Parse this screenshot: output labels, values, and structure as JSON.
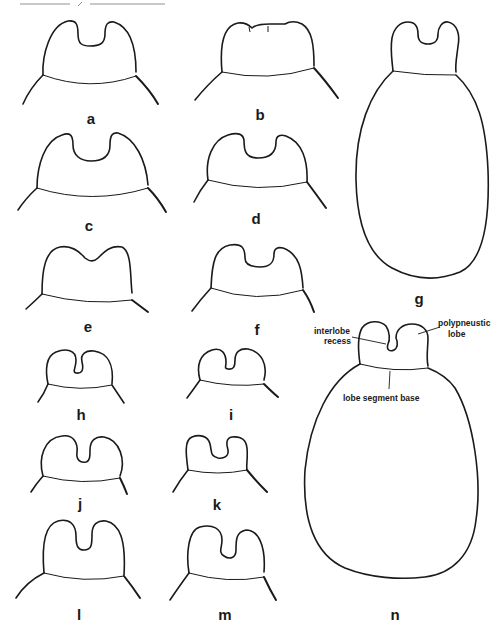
{
  "figure": {
    "panels": [
      {
        "id": "a",
        "label": "a"
      },
      {
        "id": "b",
        "label": "b"
      },
      {
        "id": "c",
        "label": "c"
      },
      {
        "id": "d",
        "label": "d"
      },
      {
        "id": "e",
        "label": "e"
      },
      {
        "id": "f",
        "label": "f"
      },
      {
        "id": "g",
        "label": "g"
      },
      {
        "id": "h",
        "label": "h"
      },
      {
        "id": "i",
        "label": "i"
      },
      {
        "id": "j",
        "label": "j"
      },
      {
        "id": "k",
        "label": "k"
      },
      {
        "id": "l",
        "label": "l"
      },
      {
        "id": "m",
        "label": "m"
      },
      {
        "id": "n",
        "label": "n"
      }
    ],
    "annotations": {
      "interlobe_recess_line1": "interlobe",
      "interlobe_recess_line2": "recess",
      "polypneustic_lobe_line1": "polypneustic",
      "polypneustic_lobe_line2": "lobe",
      "lobe_segment_base": "lobe segment base"
    },
    "colors": {
      "stroke": "#1a1a1a",
      "background": "#ffffff"
    }
  }
}
